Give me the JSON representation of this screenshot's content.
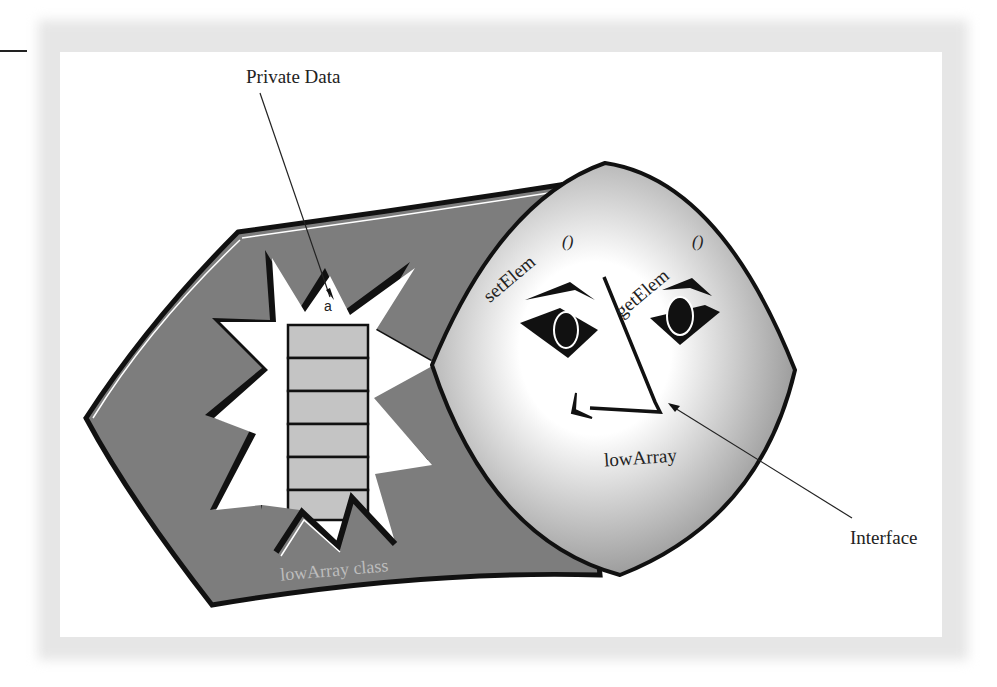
{
  "figure": {
    "labels": {
      "private_data": "Private Data",
      "interface": "Interface",
      "object_name": "lowArray",
      "class_name": "lowArray class",
      "array_ref": "a",
      "method_left": "setElem",
      "method_right": "getElem",
      "method_paren": "()"
    },
    "array": {
      "cell_count": 6
    },
    "colors": {
      "blob_fill": "#7d7d7d",
      "cell_fill": "#c4c4c4",
      "outline": "#111111",
      "face_light": "#ffffff",
      "face_shade": "#9a9a9a",
      "frame_shadow": "#e6e6e6",
      "class_label": "#bdbdbd"
    }
  }
}
